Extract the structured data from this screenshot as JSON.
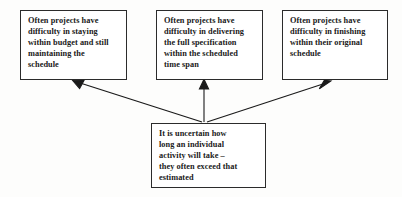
{
  "diagram": {
    "type": "cause-and-effect-diagram",
    "ink_color": "#1a1a1a",
    "box_border_color": "#2b2b2b",
    "background_color": "#fdfdfc",
    "cause": {
      "id": "uncertainty",
      "text": "It is uncertain how long an individual activity will take – they often exceed that estimated",
      "lines": [
        "It is uncertain how",
        "long an individual",
        "activity will take –",
        "they often exceed that",
        "estimated"
      ]
    },
    "effects": [
      {
        "id": "budget",
        "text": "Often projects have difficulty in staying within budget and still maintaining the schedule",
        "lines": [
          "Often projects have",
          "difficulty in staying",
          "within budget and still",
          "maintaining the",
          "schedule"
        ]
      },
      {
        "id": "specification",
        "text": "Often projects have difficulty in delivering the full specification within the scheduled time span",
        "lines": [
          "Often projects have",
          "difficulty in delivering",
          "the full specification",
          "within the scheduled",
          "time span"
        ]
      },
      {
        "id": "finishing",
        "text": "Often projects have difficulty in finishing within their original schedule",
        "lines": [
          "Often projects have",
          "difficulty in finishing",
          "within their original",
          "schedule"
        ]
      }
    ],
    "connectors": [
      {
        "id": "cause-to-budget",
        "from": "uncertainty",
        "to": "budget",
        "direction": "up-left"
      },
      {
        "id": "cause-to-specification",
        "from": "uncertainty",
        "to": "specification",
        "direction": "up"
      },
      {
        "id": "cause-to-finishing",
        "from": "uncertainty",
        "to": "finishing",
        "direction": "up-right"
      }
    ]
  }
}
